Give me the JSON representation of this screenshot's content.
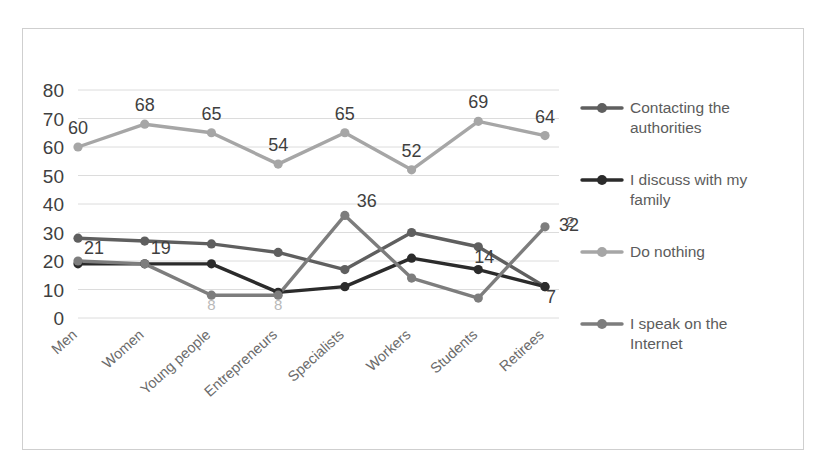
{
  "chart_data": {
    "type": "line",
    "title": "",
    "xlabel": "",
    "ylabel": "",
    "ylim": [
      0,
      80
    ],
    "ytick_step": 10,
    "grid": true,
    "legend_position": "right",
    "categories": [
      "Men",
      "Women",
      "Young people",
      "Entrepreneurs",
      "Specialists",
      "Workers",
      "Students",
      "Retirees"
    ],
    "ytick_labels": [
      "80",
      "70",
      "60",
      "50",
      "40",
      "30",
      "20",
      "10",
      "0"
    ],
    "series": [
      {
        "name": "Contacting the authorities",
        "color": "#5f5f5f",
        "values": [
          28,
          27,
          26,
          23,
          17,
          30,
          25,
          11
        ],
        "labels": [
          "",
          "",
          "",
          "",
          "",
          "",
          "14",
          "7"
        ]
      },
      {
        "name": "I discuss with my family",
        "color": "#2b2b2b",
        "values": [
          19,
          19,
          19,
          9,
          11,
          21,
          17,
          11
        ],
        "labels": [
          "21",
          "19",
          "",
          "",
          "",
          "",
          "",
          ""
        ]
      },
      {
        "name": "Do nothing",
        "color": "#a6a6a6",
        "values": [
          60,
          68,
          65,
          54,
          65,
          52,
          69,
          64
        ],
        "labels": [
          "60",
          "68",
          "65",
          "54",
          "65",
          "52",
          "69",
          "64"
        ]
      },
      {
        "name": "I speak on the Internet",
        "color": "#7d7d7d",
        "values": [
          20,
          19,
          8,
          8,
          36,
          14,
          7,
          32
        ],
        "labels": [
          "",
          "",
          "8",
          "8",
          "36",
          "",
          "",
          "32"
        ]
      }
    ]
  },
  "legend": {
    "items": [
      {
        "label": "Contacting the authorities",
        "color": "#5f5f5f"
      },
      {
        "label": "I discuss with my family",
        "color": "#2b2b2b"
      },
      {
        "label": "Do nothing",
        "color": "#a6a6a6"
      },
      {
        "label": "I speak on the Internet",
        "color": "#7d7d7d"
      }
    ]
  },
  "stray": {
    "mark": "2"
  }
}
